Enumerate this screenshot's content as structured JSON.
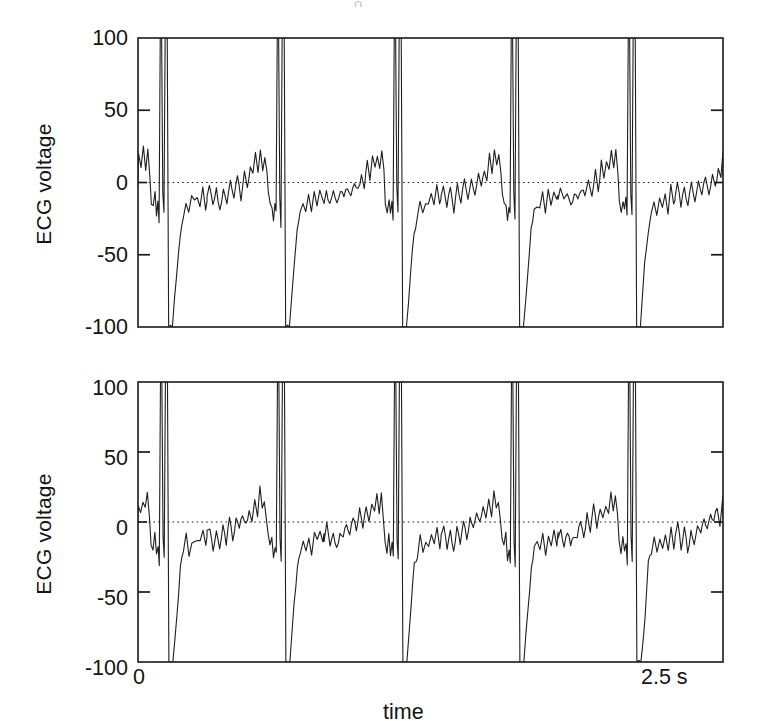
{
  "figure": {
    "background": "#ffffff",
    "ink": "#1a1a1a",
    "top_artifact_text": "o"
  },
  "panels": [
    {
      "id": "top",
      "ylabel": "ECG voltage",
      "ytick_labels": [
        "100",
        "50",
        "0",
        "-50",
        "-100"
      ],
      "xtick_labels": [],
      "xlabel": ""
    },
    {
      "id": "bottom",
      "ylabel": "ECG voltage",
      "ytick_labels": [
        "100",
        "50",
        "0",
        "-50",
        "-100"
      ],
      "xtick_labels": [
        "0",
        "2.5 s"
      ],
      "xlabel": "time"
    }
  ],
  "chart_data": {
    "type": "line",
    "title": "",
    "subtitle": "",
    "xlabel": "time",
    "ylabel": "ECG voltage",
    "xlim": [
      0,
      2.5
    ],
    "ylim": [
      -100,
      100
    ],
    "xtick_values": [
      0,
      2.5
    ],
    "xtick_labels": [
      "0",
      "2.5 s"
    ],
    "ytick_values": [
      100,
      50,
      0,
      -50,
      -100
    ],
    "ytick_labels": [
      "100",
      "50",
      "0",
      "-50",
      "-100"
    ],
    "ytick_marks_drawn_at": [
      50,
      0,
      -50
    ],
    "grid": false,
    "zero_reference_line": {
      "value": 0,
      "style": "dotted"
    },
    "legend": null,
    "x_units": "s",
    "y_units": "arbitrary (clipped at +/-100)",
    "n_beats_visible": 5,
    "beat_period_s": 0.5,
    "qrs_onset_times_s": [
      0.295,
      0.795,
      1.295,
      1.795,
      2.295
    ],
    "series": [
      {
        "name": "ECG channel 1",
        "panel": "top",
        "color": "#1f1f1f",
        "linewidth": 1.1,
        "clipped_high": 100,
        "clipped_low": -100,
        "beat_envelope": [
          {
            "t": 0.0,
            "v": -12
          },
          {
            "t": 0.01,
            "v": -4
          },
          {
            "t": 0.025,
            "v": -15
          },
          {
            "t": 0.04,
            "v": -6
          },
          {
            "t": 0.055,
            "v": -16
          },
          {
            "t": 0.07,
            "v": -5
          },
          {
            "t": 0.085,
            "v": -13
          },
          {
            "t": 0.1,
            "v": -2
          },
          {
            "t": 0.115,
            "v": -10
          },
          {
            "t": 0.13,
            "v": 2
          },
          {
            "t": 0.145,
            "v": -8
          },
          {
            "t": 0.16,
            "v": 6
          },
          {
            "t": 0.172,
            "v": -4
          },
          {
            "t": 0.185,
            "v": 12
          },
          {
            "t": 0.196,
            "v": 2
          },
          {
            "t": 0.207,
            "v": 18
          },
          {
            "t": 0.218,
            "v": 8
          },
          {
            "t": 0.228,
            "v": 22
          },
          {
            "t": 0.238,
            "v": 10
          },
          {
            "t": 0.247,
            "v": 20
          },
          {
            "t": 0.256,
            "v": 6
          },
          {
            "t": 0.262,
            "v": -10
          },
          {
            "t": 0.27,
            "v": -18
          },
          {
            "t": 0.278,
            "v": -12
          },
          {
            "t": 0.284,
            "v": -22
          },
          {
            "t": 0.29,
            "v": -14
          },
          {
            "t": 0.295,
            "v": -24
          },
          {
            "t": 0.3,
            "v": 100
          },
          {
            "t": 0.306,
            "v": 100
          },
          {
            "t": 0.311,
            "v": -8
          },
          {
            "t": 0.316,
            "v": -26
          },
          {
            "t": 0.321,
            "v": 100
          },
          {
            "t": 0.33,
            "v": 100
          },
          {
            "t": 0.336,
            "v": -100
          },
          {
            "t": 0.352,
            "v": -100
          },
          {
            "t": 0.37,
            "v": -62
          },
          {
            "t": 0.385,
            "v": -34
          },
          {
            "t": 0.398,
            "v": -20
          },
          {
            "t": 0.41,
            "v": -14
          },
          {
            "t": 0.422,
            "v": -20
          },
          {
            "t": 0.434,
            "v": -10
          },
          {
            "t": 0.446,
            "v": -18
          },
          {
            "t": 0.458,
            "v": -8
          },
          {
            "t": 0.47,
            "v": -16
          },
          {
            "t": 0.482,
            "v": -4
          },
          {
            "t": 0.494,
            "v": -14
          },
          {
            "t": 0.5,
            "v": -12
          }
        ]
      },
      {
        "name": "ECG channel 2",
        "panel": "bottom",
        "color": "#1f1f1f",
        "linewidth": 1.1,
        "clipped_high": 100,
        "clipped_low": -100,
        "beat_envelope": [
          {
            "t": 0.0,
            "v": -10
          },
          {
            "t": 0.012,
            "v": -3
          },
          {
            "t": 0.026,
            "v": -17
          },
          {
            "t": 0.04,
            "v": -8
          },
          {
            "t": 0.054,
            "v": -18
          },
          {
            "t": 0.068,
            "v": -7
          },
          {
            "t": 0.082,
            "v": -14
          },
          {
            "t": 0.096,
            "v": 0
          },
          {
            "t": 0.11,
            "v": -11
          },
          {
            "t": 0.124,
            "v": 4
          },
          {
            "t": 0.138,
            "v": -6
          },
          {
            "t": 0.152,
            "v": 8
          },
          {
            "t": 0.166,
            "v": -3
          },
          {
            "t": 0.18,
            "v": 10
          },
          {
            "t": 0.192,
            "v": 1
          },
          {
            "t": 0.204,
            "v": 16
          },
          {
            "t": 0.216,
            "v": 6
          },
          {
            "t": 0.226,
            "v": 21
          },
          {
            "t": 0.236,
            "v": 9
          },
          {
            "t": 0.245,
            "v": 18
          },
          {
            "t": 0.254,
            "v": 2
          },
          {
            "t": 0.261,
            "v": -14
          },
          {
            "t": 0.269,
            "v": -20
          },
          {
            "t": 0.277,
            "v": -10
          },
          {
            "t": 0.284,
            "v": -24
          },
          {
            "t": 0.291,
            "v": -16
          },
          {
            "t": 0.296,
            "v": -26
          },
          {
            "t": 0.301,
            "v": 100
          },
          {
            "t": 0.307,
            "v": 100
          },
          {
            "t": 0.312,
            "v": -12
          },
          {
            "t": 0.317,
            "v": -28
          },
          {
            "t": 0.322,
            "v": 100
          },
          {
            "t": 0.331,
            "v": 100
          },
          {
            "t": 0.337,
            "v": -100
          },
          {
            "t": 0.354,
            "v": -100
          },
          {
            "t": 0.372,
            "v": -58
          },
          {
            "t": 0.386,
            "v": -30
          },
          {
            "t": 0.399,
            "v": -22
          },
          {
            "t": 0.411,
            "v": -12
          },
          {
            "t": 0.423,
            "v": -21
          },
          {
            "t": 0.435,
            "v": -11
          },
          {
            "t": 0.447,
            "v": -19
          },
          {
            "t": 0.459,
            "v": -9
          },
          {
            "t": 0.471,
            "v": -17
          },
          {
            "t": 0.483,
            "v": -6
          },
          {
            "t": 0.495,
            "v": -15
          },
          {
            "t": 0.5,
            "v": -11
          }
        ]
      }
    ]
  }
}
